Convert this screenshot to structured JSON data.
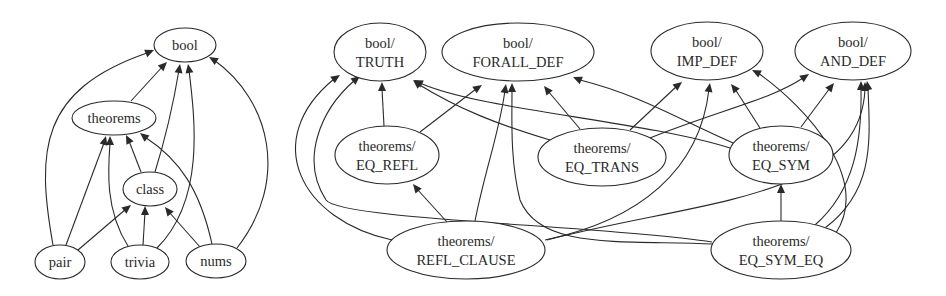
{
  "graphs": [
    {
      "name": "theory-dependency-graph",
      "nodes": [
        {
          "id": "bool",
          "lines": [
            "bool"
          ],
          "cx": 185,
          "cy": 45,
          "rx": 31,
          "ry": 17
        },
        {
          "id": "theorems",
          "lines": [
            "theorems"
          ],
          "cx": 114,
          "cy": 118,
          "rx": 42,
          "ry": 17
        },
        {
          "id": "class",
          "lines": [
            "class"
          ],
          "cx": 150,
          "cy": 189,
          "rx": 27,
          "ry": 17
        },
        {
          "id": "pair",
          "lines": [
            "pair"
          ],
          "cx": 60,
          "cy": 262,
          "rx": 25,
          "ry": 17
        },
        {
          "id": "trivia",
          "lines": [
            "trivia"
          ],
          "cx": 140,
          "cy": 262,
          "rx": 29,
          "ry": 17
        },
        {
          "id": "nums",
          "lines": [
            "nums"
          ],
          "cx": 216,
          "cy": 261,
          "rx": 30,
          "ry": 17
        }
      ],
      "edges": [
        {
          "from": "theorems",
          "to": "bool",
          "d": "M131,101 L163,66",
          "tip": [
            167,
            62
          ]
        },
        {
          "from": "pair",
          "to": "bool",
          "d": "M53,245 C36,150 40,90 147,53",
          "tip": [
            154,
            50
          ]
        },
        {
          "from": "class",
          "to": "bool",
          "d": "M155,172 C168,130 174,100 179,70",
          "tip": [
            180,
            64
          ]
        },
        {
          "from": "trivia",
          "to": "bool",
          "d": "M157,248 C205,200 195,120 189,70",
          "tip": [
            188,
            64
          ]
        },
        {
          "from": "nums",
          "to": "bool",
          "d": "M237,248 C290,180 270,100 214,60",
          "tip": [
            209,
            57
          ]
        },
        {
          "from": "class",
          "to": "theorems",
          "d": "M141,172 L129,141",
          "tip": [
            126,
            135
          ]
        },
        {
          "from": "pair",
          "to": "theorems",
          "d": "M66,245 L104,143",
          "tip": [
            106,
            136
          ]
        },
        {
          "from": "trivia",
          "to": "theorems",
          "d": "M128,246 C105,210 108,170 110,143",
          "tip": [
            110,
            136
          ]
        },
        {
          "from": "nums",
          "to": "theorems",
          "d": "M212,244 C200,190 180,160 145,137",
          "tip": [
            140,
            133
          ]
        },
        {
          "from": "pair",
          "to": "class",
          "d": "M78,250 L126,209",
          "tip": [
            131,
            205
          ]
        },
        {
          "from": "trivia",
          "to": "class",
          "d": "M143,245 L145,212",
          "tip": [
            145,
            206
          ]
        },
        {
          "from": "nums",
          "to": "class",
          "d": "M200,247 L169,212",
          "tip": [
            165,
            207
          ]
        }
      ]
    },
    {
      "name": "theorem-dependency-graph",
      "nodes": [
        {
          "id": "bool/TRUTH",
          "lines": [
            "bool/",
            "TRUTH"
          ],
          "cx": 380,
          "cy": 52,
          "rx": 46,
          "ry": 29
        },
        {
          "id": "bool/FORALL_DEF",
          "lines": [
            "bool/",
            "FORALL_DEF"
          ],
          "cx": 518,
          "cy": 52,
          "rx": 76,
          "ry": 29
        },
        {
          "id": "bool/IMP_DEF",
          "lines": [
            "bool/",
            "IMP_DEF"
          ],
          "cx": 707,
          "cy": 51,
          "rx": 56,
          "ry": 29
        },
        {
          "id": "bool/AND_DEF",
          "lines": [
            "bool/",
            "AND_DEF"
          ],
          "cx": 853,
          "cy": 51,
          "rx": 58,
          "ry": 29
        },
        {
          "id": "theorems/EQ_REFL",
          "lines": [
            "theorems/",
            "EQ_REFL"
          ],
          "cx": 387,
          "cy": 155,
          "rx": 52,
          "ry": 29
        },
        {
          "id": "theorems/EQ_TRANS",
          "lines": [
            "theorems/",
            "EQ_TRANS"
          ],
          "cx": 602,
          "cy": 157,
          "rx": 64,
          "ry": 29
        },
        {
          "id": "theorems/EQ_SYM",
          "lines": [
            "theorems/",
            "EQ_SYM"
          ],
          "cx": 781,
          "cy": 155,
          "rx": 52,
          "ry": 29
        },
        {
          "id": "theorems/REFL_CLAUSE",
          "lines": [
            "theorems/",
            "REFL_CLAUSE"
          ],
          "cx": 466,
          "cy": 250,
          "rx": 79,
          "ry": 29
        },
        {
          "id": "theorems/EQ_SYM_EQ",
          "lines": [
            "theorems/",
            "EQ_SYM_EQ"
          ],
          "cx": 781,
          "cy": 250,
          "rx": 70,
          "ry": 29
        }
      ],
      "edges": [
        {
          "from": "theorems/EQ_REFL",
          "to": "bool/TRUTH",
          "d": "M384,126 L382,89",
          "tip": [
            382,
            82
          ]
        },
        {
          "from": "theorems/EQ_REFL",
          "to": "bool/FORALL_DEF",
          "d": "M420,132 L476,89",
          "tip": [
            482,
            85
          ]
        },
        {
          "from": "theorems/REFL_CLAUSE",
          "to": "bool/TRUTH",
          "d": "M392,240 C300,220 260,140 334,79",
          "tip": [
            340,
            75
          ]
        },
        {
          "from": "theorems/REFL_CLAUSE",
          "to": "bool/FORALL_DEF",
          "d": "M475,221 C485,170 500,130 505,90",
          "tip": [
            506,
            84
          ]
        },
        {
          "from": "theorems/REFL_CLAUSE",
          "to": "theorems/EQ_REFL",
          "d": "M447,222 L417,189",
          "tip": [
            413,
            184
          ]
        },
        {
          "from": "theorems/REFL_CLAUSE",
          "to": "bool/IMP_DEF",
          "d": "M545,240 C640,220 700,170 709,89",
          "tip": [
            710,
            83
          ]
        },
        {
          "from": "theorems/REFL_CLAUSE",
          "to": "bool/AND_DEF",
          "d": "M547,240 C700,200 860,200 865,89",
          "tip": [
            865,
            82
          ]
        },
        {
          "from": "theorems/EQ_TRANS",
          "to": "bool/TRUTH",
          "d": "M550,140 C500,125 460,110 418,84",
          "tip": [
            413,
            80
          ]
        },
        {
          "from": "theorems/EQ_TRANS",
          "to": "bool/FORALL_DEF",
          "d": "M580,129 L548,91",
          "tip": [
            544,
            86
          ]
        },
        {
          "from": "theorems/EQ_TRANS",
          "to": "bool/IMP_DEF",
          "d": "M630,130 L677,86",
          "tip": [
            682,
            82
          ]
        },
        {
          "from": "theorems/EQ_TRANS",
          "to": "bool/AND_DEF",
          "d": "M650,138 C720,110 770,100 803,78",
          "tip": [
            809,
            74
          ]
        },
        {
          "from": "theorems/EQ_SYM",
          "to": "bool/TRUTH",
          "d": "M730,148 C640,120 480,110 420,83",
          "tip": [
            414,
            80
          ]
        },
        {
          "from": "theorems/EQ_SYM",
          "to": "bool/FORALL_DEF",
          "d": "M733,143 C680,120 640,95 580,80",
          "tip": [
            573,
            77
          ]
        },
        {
          "from": "theorems/EQ_SYM",
          "to": "bool/IMP_DEF",
          "d": "M760,128 L735,89",
          "tip": [
            731,
            84
          ]
        },
        {
          "from": "theorems/EQ_SYM",
          "to": "bool/AND_DEF",
          "d": "M801,127 L830,88",
          "tip": [
            834,
            83
          ]
        },
        {
          "from": "theorems/EQ_SYM_EQ",
          "to": "theorems/EQ_SYM",
          "d": "M781,221 L781,191",
          "tip": [
            781,
            184
          ]
        },
        {
          "from": "theorems/EQ_SYM_EQ",
          "to": "bool/TRUTH",
          "d": "M712,242 C600,225 340,220 326,200 C300,160 320,110 355,80",
          "tip": [
            360,
            76
          ]
        },
        {
          "from": "theorems/EQ_SYM_EQ",
          "to": "bool/FORALL_DEF",
          "d": "M713,244 C620,240 540,250 520,200 C510,160 512,120 512,90",
          "tip": [
            512,
            83
          ]
        },
        {
          "from": "theorems/EQ_SYM_EQ",
          "to": "bool/IMP_DEF",
          "d": "M836,233 C870,180 810,110 758,73",
          "tip": [
            752,
            70
          ]
        },
        {
          "from": "theorems/EQ_SYM_EQ",
          "to": "bool/AND_DEF",
          "d": "M815,225 C855,190 862,140 861,88",
          "tip": [
            861,
            81
          ]
        },
        {
          "from": "theorems/EQ_SYM_EQ",
          "to": "bool/AND_DEF",
          "d": "M825,228 C875,190 870,140 868,88",
          "tip": [
            867,
            81
          ]
        }
      ]
    }
  ]
}
